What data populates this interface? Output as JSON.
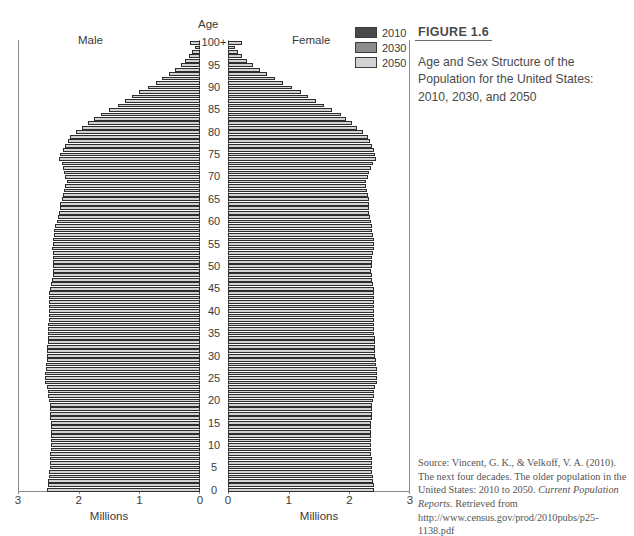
{
  "figure": {
    "number": "FIGURE 1.6",
    "title": "Age and Sex Structure of the Population for the United States: 2010, 2030, and 2050",
    "source_line1": "Source: Vincent, G. K., & Velkoff, V. A. (2010).",
    "source_line2": "The next four decades. The older population in",
    "source_line3": "the United States: 2010 to 2050. ",
    "source_italic1": "Current",
    "source_line4": "Population Reports",
    "source_line5": ". Retrieved from",
    "source_line6": "http://www.census.gov/prod/2010pubs/p25-",
    "source_line7": "1138.pdf"
  },
  "legend": {
    "position": "top-right",
    "items": [
      {
        "label": "2010",
        "color": "#4a4a4a"
      },
      {
        "label": "2030",
        "color": "#8c8c8c"
      },
      {
        "label": "2050",
        "color": "#d2d2d2"
      }
    ]
  },
  "labels": {
    "male": "Male",
    "female": "Female",
    "age_axis": "Age",
    "x_axis_male": "Millions",
    "x_axis_female": "Millions"
  },
  "chart_data": {
    "type": "bar",
    "subtype": "population-pyramid",
    "title": "Age and Sex Structure of the Population for the United States: 2010, 2030, and 2050",
    "xlabel": "Millions",
    "ylabel": "Age",
    "grid": false,
    "orientation": "horizontal",
    "xlim_male": [
      3,
      0
    ],
    "xlim_female": [
      0,
      3
    ],
    "ylim": [
      0,
      100
    ],
    "x_ticks_male": [
      3,
      2,
      1,
      0
    ],
    "x_ticks_female": [
      0,
      1,
      2,
      3
    ],
    "age_ticks": [
      "0",
      "5",
      "10",
      "15",
      "20",
      "25",
      "30",
      "35",
      "40",
      "45",
      "50",
      "55",
      "60",
      "65",
      "70",
      "75",
      "80",
      "85",
      "90",
      "95",
      "100+"
    ],
    "age_groups": [
      0,
      1,
      2,
      3,
      4,
      5,
      6,
      7,
      8,
      9,
      10,
      11,
      12,
      13,
      14,
      15,
      16,
      17,
      18,
      19,
      20,
      21,
      22,
      23,
      24,
      25,
      26,
      27,
      28,
      29,
      30,
      31,
      32,
      33,
      34,
      35,
      36,
      37,
      38,
      39,
      40,
      41,
      42,
      43,
      44,
      45,
      46,
      47,
      48,
      49,
      50,
      51,
      52,
      53,
      54,
      55,
      56,
      57,
      58,
      59,
      60,
      61,
      62,
      63,
      64,
      65,
      66,
      67,
      68,
      69,
      70,
      71,
      72,
      73,
      74,
      75,
      76,
      77,
      78,
      79,
      80,
      81,
      82,
      83,
      84,
      85,
      86,
      87,
      88,
      89,
      90,
      91,
      92,
      93,
      94,
      95,
      96,
      97,
      98,
      99,
      100
    ],
    "series": [
      {
        "name": "2010",
        "color": "#4a4a4a",
        "male": [
          2.18,
          2.16,
          2.14,
          2.13,
          2.12,
          2.1,
          2.09,
          2.08,
          2.07,
          2.06,
          2.12,
          2.14,
          2.16,
          2.18,
          2.22,
          2.24,
          2.26,
          2.27,
          2.26,
          2.22,
          2.18,
          2.14,
          2.12,
          2.12,
          2.14,
          2.12,
          2.08,
          2.06,
          2.06,
          2.1,
          2.12,
          2.08,
          2.04,
          2.0,
          1.98,
          2.0,
          2.04,
          2.08,
          2.12,
          2.16,
          2.2,
          2.26,
          2.3,
          2.34,
          2.36,
          2.34,
          2.3,
          2.26,
          2.22,
          2.18,
          2.12,
          2.06,
          2.0,
          1.94,
          1.88,
          1.8,
          1.72,
          1.66,
          1.6,
          1.54,
          1.46,
          1.4,
          1.32,
          1.24,
          1.16,
          1.08,
          1.0,
          0.94,
          0.88,
          0.82,
          0.76,
          0.7,
          0.64,
          0.6,
          0.56,
          0.52,
          0.48,
          0.45,
          0.42,
          0.39,
          0.36,
          0.33,
          0.3,
          0.27,
          0.24,
          0.21,
          0.18,
          0.155,
          0.13,
          0.11,
          0.09,
          0.072,
          0.058,
          0.045,
          0.035,
          0.026,
          0.019,
          0.014,
          0.01,
          0.007,
          0.012
        ],
        "female": [
          2.08,
          2.07,
          2.06,
          2.05,
          2.04,
          2.02,
          2.01,
          2.0,
          1.99,
          1.98,
          2.03,
          2.05,
          2.07,
          2.09,
          2.12,
          2.14,
          2.16,
          2.17,
          2.17,
          2.14,
          2.12,
          2.1,
          2.09,
          2.1,
          2.12,
          2.1,
          2.07,
          2.05,
          2.05,
          2.09,
          2.11,
          2.08,
          2.04,
          2.01,
          1.99,
          2.01,
          2.05,
          2.09,
          2.13,
          2.17,
          2.22,
          2.28,
          2.32,
          2.36,
          2.38,
          2.37,
          2.34,
          2.3,
          2.27,
          2.23,
          2.18,
          2.13,
          2.08,
          2.03,
          1.97,
          1.9,
          1.83,
          1.77,
          1.71,
          1.66,
          1.59,
          1.53,
          1.46,
          1.38,
          1.3,
          1.22,
          1.14,
          1.08,
          1.02,
          0.97,
          0.92,
          0.86,
          0.8,
          0.76,
          0.72,
          0.69,
          0.66,
          0.63,
          0.6,
          0.57,
          0.54,
          0.51,
          0.48,
          0.44,
          0.4,
          0.36,
          0.32,
          0.28,
          0.245,
          0.21,
          0.175,
          0.145,
          0.118,
          0.095,
          0.074,
          0.056,
          0.041,
          0.03,
          0.021,
          0.015,
          0.026
        ]
      },
      {
        "name": "2030",
        "color": "#8c8c8c",
        "male": [
          2.32,
          2.31,
          2.3,
          2.29,
          2.28,
          2.27,
          2.26,
          2.25,
          2.25,
          2.24,
          2.24,
          2.24,
          2.24,
          2.24,
          2.24,
          2.25,
          2.26,
          2.27,
          2.28,
          2.29,
          2.3,
          2.31,
          2.33,
          2.35,
          2.37,
          2.37,
          2.36,
          2.35,
          2.34,
          2.33,
          2.32,
          2.31,
          2.3,
          2.29,
          2.28,
          2.27,
          2.26,
          2.25,
          2.25,
          2.24,
          2.24,
          2.24,
          2.24,
          2.24,
          2.24,
          2.22,
          2.2,
          2.18,
          2.16,
          2.14,
          2.16,
          2.18,
          2.2,
          2.22,
          2.26,
          2.26,
          2.24,
          2.22,
          2.2,
          2.18,
          2.14,
          2.1,
          2.08,
          2.08,
          2.1,
          2.08,
          2.04,
          2.0,
          1.96,
          1.92,
          1.86,
          1.8,
          1.74,
          1.68,
          1.62,
          1.54,
          1.46,
          1.38,
          1.3,
          1.22,
          1.12,
          1.02,
          0.94,
          0.86,
          0.78,
          0.68,
          0.6,
          0.53,
          0.46,
          0.4,
          0.33,
          0.27,
          0.22,
          0.175,
          0.135,
          0.1,
          0.073,
          0.052,
          0.036,
          0.025,
          0.042
        ],
        "female": [
          2.22,
          2.21,
          2.2,
          2.19,
          2.18,
          2.17,
          2.17,
          2.16,
          2.16,
          2.15,
          2.15,
          2.15,
          2.15,
          2.15,
          2.16,
          2.17,
          2.18,
          2.19,
          2.2,
          2.21,
          2.22,
          2.23,
          2.25,
          2.27,
          2.29,
          2.29,
          2.28,
          2.28,
          2.27,
          2.26,
          2.25,
          2.24,
          2.23,
          2.23,
          2.22,
          2.21,
          2.21,
          2.2,
          2.2,
          2.2,
          2.2,
          2.2,
          2.2,
          2.2,
          2.2,
          2.19,
          2.17,
          2.16,
          2.14,
          2.13,
          2.15,
          2.17,
          2.2,
          2.22,
          2.27,
          2.28,
          2.26,
          2.25,
          2.23,
          2.21,
          2.18,
          2.15,
          2.13,
          2.14,
          2.17,
          2.15,
          2.12,
          2.08,
          2.05,
          2.01,
          1.96,
          1.91,
          1.85,
          1.8,
          1.74,
          1.67,
          1.59,
          1.52,
          1.44,
          1.36,
          1.26,
          1.17,
          1.08,
          1.0,
          0.92,
          0.82,
          0.73,
          0.65,
          0.57,
          0.5,
          0.42,
          0.35,
          0.29,
          0.235,
          0.185,
          0.142,
          0.106,
          0.078,
          0.055,
          0.039,
          0.075
        ]
      },
      {
        "name": "2050",
        "color": "#d2d2d2",
        "male": [
          2.52,
          2.51,
          2.5,
          2.49,
          2.49,
          2.48,
          2.48,
          2.47,
          2.47,
          2.46,
          2.46,
          2.46,
          2.46,
          2.46,
          2.46,
          2.46,
          2.47,
          2.47,
          2.48,
          2.48,
          2.49,
          2.5,
          2.51,
          2.53,
          2.55,
          2.55,
          2.55,
          2.54,
          2.54,
          2.53,
          2.53,
          2.52,
          2.52,
          2.51,
          2.51,
          2.5,
          2.5,
          2.5,
          2.49,
          2.49,
          2.49,
          2.49,
          2.49,
          2.49,
          2.49,
          2.47,
          2.46,
          2.44,
          2.43,
          2.42,
          2.42,
          2.42,
          2.43,
          2.43,
          2.44,
          2.43,
          2.42,
          2.41,
          2.4,
          2.39,
          2.36,
          2.34,
          2.32,
          2.31,
          2.3,
          2.28,
          2.26,
          2.24,
          2.22,
          2.2,
          2.22,
          2.24,
          2.26,
          2.28,
          2.32,
          2.3,
          2.26,
          2.22,
          2.18,
          2.14,
          2.04,
          1.94,
          1.84,
          1.74,
          1.64,
          1.5,
          1.36,
          1.24,
          1.12,
          1.0,
          0.86,
          0.73,
          0.62,
          0.51,
          0.41,
          0.32,
          0.24,
          0.175,
          0.125,
          0.088,
          0.165
        ],
        "female": [
          2.41,
          2.4,
          2.39,
          2.39,
          2.38,
          2.38,
          2.37,
          2.37,
          2.36,
          2.36,
          2.36,
          2.36,
          2.36,
          2.36,
          2.36,
          2.36,
          2.37,
          2.37,
          2.38,
          2.38,
          2.39,
          2.4,
          2.41,
          2.43,
          2.45,
          2.45,
          2.45,
          2.45,
          2.44,
          2.44,
          2.43,
          2.43,
          2.42,
          2.42,
          2.42,
          2.41,
          2.41,
          2.41,
          2.41,
          2.41,
          2.41,
          2.41,
          2.41,
          2.41,
          2.41,
          2.4,
          2.39,
          2.38,
          2.37,
          2.36,
          2.37,
          2.37,
          2.38,
          2.39,
          2.41,
          2.4,
          2.4,
          2.39,
          2.38,
          2.38,
          2.36,
          2.34,
          2.33,
          2.33,
          2.33,
          2.32,
          2.3,
          2.29,
          2.28,
          2.27,
          2.3,
          2.33,
          2.36,
          2.39,
          2.44,
          2.43,
          2.4,
          2.37,
          2.34,
          2.31,
          2.22,
          2.13,
          2.04,
          1.95,
          1.86,
          1.72,
          1.58,
          1.45,
          1.32,
          1.2,
          1.05,
          0.9,
          0.77,
          0.64,
          0.52,
          0.41,
          0.31,
          0.23,
          0.165,
          0.118,
          0.235
        ]
      }
    ]
  }
}
